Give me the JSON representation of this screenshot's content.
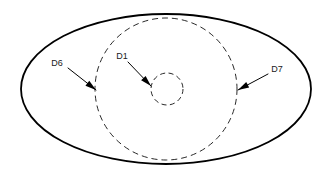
{
  "diagram": {
    "type": "concentric-dimension-diagram",
    "background_color": "#ffffff",
    "line_color": "#000000",
    "text_color": "#1a1a1a",
    "shapes": {
      "outer_ellipse": {
        "name": "outer-ellipse",
        "style": "solid",
        "cx": 166,
        "cy": 89,
        "rx": 145,
        "ry": 75,
        "stroke_width": 1.8
      },
      "large_circle": {
        "name": "large-dashed-circle",
        "style": "dashed",
        "cx": 166,
        "cy": 89,
        "r": 71,
        "stroke_width": 0.9,
        "dash_pattern": "6 4"
      },
      "small_circle": {
        "name": "small-dashed-circle",
        "style": "dashed",
        "cx": 167,
        "cy": 89,
        "r": 16,
        "stroke_width": 0.9,
        "dash_pattern": "5 3.5"
      }
    },
    "callouts": [
      {
        "id": "D6",
        "label": "D6",
        "label_x": 57,
        "label_y": 64,
        "leader_start_x": 68,
        "leader_start_y": 68,
        "leader_end_x": 96,
        "leader_end_y": 90,
        "target": "large-dashed-circle",
        "arrow_angle_deg": 38
      },
      {
        "id": "D1",
        "label": "D1",
        "label_x": 122,
        "label_y": 57,
        "leader_start_x": 128,
        "leader_start_y": 62,
        "leader_end_x": 151,
        "leader_end_y": 86,
        "target": "small-dashed-circle",
        "arrow_angle_deg": 46
      },
      {
        "id": "D7",
        "label": "D7",
        "label_x": 277,
        "label_y": 70,
        "leader_start_x": 268,
        "leader_start_y": 74,
        "leader_end_x": 238,
        "leader_end_y": 90,
        "target": "large-dashed-circle",
        "arrow_angle_deg": 208
      }
    ]
  }
}
